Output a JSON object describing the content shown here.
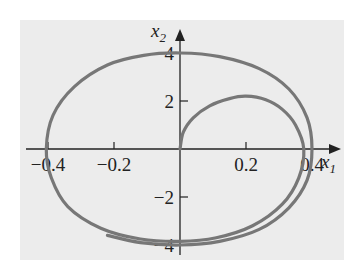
{
  "chart_data": {
    "type": "line",
    "title": "",
    "xlabel": "x1",
    "ylabel": "x2",
    "xlabel_main": "x",
    "xlabel_sub": "1",
    "ylabel_main": "x",
    "ylabel_sub": "2",
    "xlim": [
      -0.4,
      0.4
    ],
    "ylim": [
      -4,
      4
    ],
    "x_ticks": [
      -0.4,
      -0.2,
      0.2,
      0.4
    ],
    "x_tick_labels": [
      "−0.4",
      "−0.2",
      "0.2",
      "0.4"
    ],
    "y_ticks": [
      -4,
      -2,
      2,
      4
    ],
    "y_tick_labels": [
      "−4",
      "−2",
      "2",
      "4"
    ],
    "grid": false,
    "legend": null,
    "background": "#ececec",
    "line_color": "#777777",
    "series": [
      {
        "name": "phase trajectory",
        "points": [
          [
            0.0,
            0.0
          ],
          [
            0.01,
            0.7
          ],
          [
            0.04,
            1.3
          ],
          [
            0.09,
            1.8
          ],
          [
            0.15,
            2.1
          ],
          [
            0.2,
            2.2
          ],
          [
            0.26,
            2.05
          ],
          [
            0.31,
            1.65
          ],
          [
            0.35,
            1.0
          ],
          [
            0.375,
            0.0
          ],
          [
            0.36,
            -1.2
          ],
          [
            0.31,
            -2.3
          ],
          [
            0.22,
            -3.2
          ],
          [
            0.11,
            -3.7
          ],
          [
            0.0,
            -3.85
          ],
          [
            -0.12,
            -3.75
          ],
          [
            -0.24,
            -3.3
          ],
          [
            -0.34,
            -2.4
          ],
          [
            -0.39,
            -1.2
          ],
          [
            -0.405,
            0.0
          ],
          [
            -0.385,
            1.4
          ],
          [
            -0.32,
            2.6
          ],
          [
            -0.22,
            3.5
          ],
          [
            -0.11,
            3.9
          ],
          [
            0.0,
            4.0
          ],
          [
            0.12,
            3.85
          ],
          [
            0.24,
            3.35
          ],
          [
            0.33,
            2.5
          ],
          [
            0.385,
            1.3
          ],
          [
            0.4,
            0.0
          ],
          [
            0.385,
            -1.3
          ],
          [
            0.33,
            -2.45
          ],
          [
            0.24,
            -3.35
          ],
          [
            0.12,
            -3.85
          ],
          [
            0.0,
            -4.0
          ],
          [
            -0.12,
            -3.9
          ],
          [
            -0.22,
            -3.6
          ]
        ]
      }
    ]
  }
}
